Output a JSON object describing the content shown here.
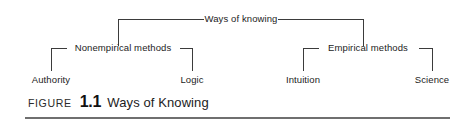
{
  "figure": {
    "caption_prefix": "FIGURE",
    "caption_number": "1.1",
    "caption_title": "Ways of Knowing"
  },
  "diagram": {
    "root": {
      "label": "Ways of knowing"
    },
    "branches": [
      {
        "label": "Nonempirical methods",
        "children": [
          {
            "label": "Authority"
          },
          {
            "label": "Logic"
          }
        ]
      },
      {
        "label": "Empirical methods",
        "children": [
          {
            "label": "Intuition"
          },
          {
            "label": "Science"
          }
        ]
      }
    ]
  },
  "style": {
    "line_color": "#3b3b3b",
    "rule_color": "#6f6f6f",
    "text_color": "#1c1c1c",
    "background": "#ffffff"
  }
}
